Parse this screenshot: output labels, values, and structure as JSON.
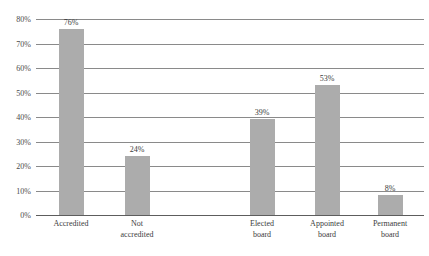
{
  "chart_data": {
    "type": "bar",
    "title": "",
    "xlabel": "",
    "ylabel": "",
    "categories": [
      "Accredited",
      "Not\naccredited",
      "Elected\nboard",
      "Appointed\nboard",
      "Permanent\nboard"
    ],
    "values": [
      76,
      24,
      39,
      53,
      8
    ],
    "value_labels": [
      "76%",
      "24%",
      "39%",
      "53%",
      "8%"
    ],
    "ylim": [
      0,
      80
    ],
    "ytick_labels": [
      "0%",
      "10%",
      "20%",
      "30%",
      "40%",
      "50%",
      "60%",
      "70%",
      "80%"
    ],
    "ytick_values": [
      0,
      10,
      20,
      30,
      40,
      50,
      60,
      70,
      80
    ],
    "grid": true,
    "legend": false,
    "bar_color": "#acacac",
    "gridline_color": "#8a8a8a",
    "axis_color": "#5d5d5d",
    "text_color": "#3c3c3c",
    "bar_positions_px": [
      71,
      137,
      262,
      327,
      390
    ],
    "bar_width_px": 25
  }
}
